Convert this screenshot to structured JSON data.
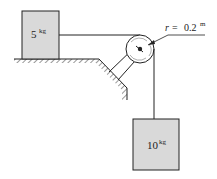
{
  "diagram": {
    "type": "pulley-system",
    "block_left": {
      "mass_value": "5",
      "mass_unit": "kg",
      "fill": "#d9d9d9"
    },
    "block_hanging": {
      "mass_value": "10",
      "mass_unit": "kg",
      "fill": "#d9d9d9"
    },
    "pulley": {
      "label_symbol": "r",
      "label_eq": "=",
      "label_value": "0.2",
      "label_unit": "m"
    },
    "colors": {
      "stroke": "#222222",
      "block_fill": "#d9d9d9",
      "background": "#ffffff"
    }
  }
}
